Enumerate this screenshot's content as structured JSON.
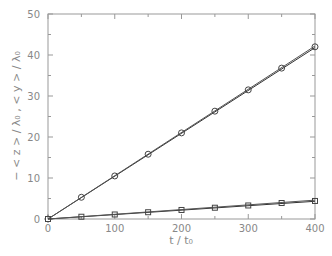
{
  "chart_data": {
    "type": "line",
    "title": "",
    "xlabel": "t / t₀",
    "ylabel": "− < z > / λ₀  ,  < y > / λ₀",
    "xlim": [
      0,
      400
    ],
    "ylim": [
      0,
      50
    ],
    "x_ticks": [
      0,
      100,
      200,
      300,
      400
    ],
    "y_ticks": [
      0,
      10,
      20,
      30,
      40,
      50
    ],
    "grid": false,
    "legend": null,
    "x": [
      0,
      50,
      100,
      150,
      200,
      250,
      300,
      350,
      400
    ],
    "series": [
      {
        "name": "<y>/λ₀ (circles)",
        "marker": "circle",
        "values": [
          0,
          5.3,
          10.5,
          15.8,
          21.0,
          26.3,
          31.5,
          36.8,
          42.0
        ],
        "fit_a": 0.1045,
        "fit_b": 0.1055
      },
      {
        "name": "−<z>/λ₀ (squares)",
        "marker": "square",
        "values": [
          0,
          0.55,
          1.1,
          1.65,
          2.2,
          2.75,
          3.3,
          3.9,
          4.4
        ],
        "fit_a": 0.0108,
        "fit_b": 0.0115
      }
    ]
  },
  "labels": {
    "x_title": "t / t₀",
    "y_title": "− < z > / λ₀  ,  < y > / λ₀",
    "x_ticks": [
      "0",
      "100",
      "200",
      "300",
      "400"
    ],
    "y_ticks": [
      "0",
      "10",
      "20",
      "30",
      "40",
      "50"
    ]
  }
}
